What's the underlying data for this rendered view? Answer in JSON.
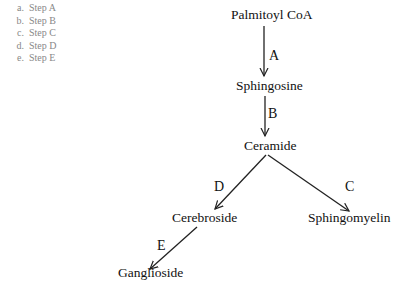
{
  "options": [
    {
      "letter": "a.",
      "label": "Step A"
    },
    {
      "letter": "b.",
      "label": "Step B"
    },
    {
      "letter": "c.",
      "label": "Step C"
    },
    {
      "letter": "d.",
      "label": "Step D"
    },
    {
      "letter": "e.",
      "label": "Step E"
    }
  ],
  "diagram": {
    "nodes": {
      "palmitoyl": "Palmitoyl CoA",
      "sphingosine": "Sphingosine",
      "ceramide": "Ceramide",
      "cerebroside": "Cerebroside",
      "sphingomyelin": "Sphingomyelin",
      "ganglioside": "Ganglioside"
    },
    "edges": {
      "A": "A",
      "B": "B",
      "C": "C",
      "D": "D",
      "E": "E"
    }
  }
}
